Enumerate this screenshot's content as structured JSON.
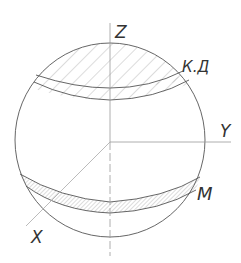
{
  "diagram": {
    "labels": {
      "z_axis": "Z",
      "y_axis": "Y",
      "x_axis": "X",
      "upper_zone": "К.Д",
      "lower_zone": "M"
    },
    "colors": {
      "stroke": "#555555",
      "axis": "#9a9a9a",
      "hatch": "#8a8a8a",
      "background": "#ffffff"
    }
  }
}
